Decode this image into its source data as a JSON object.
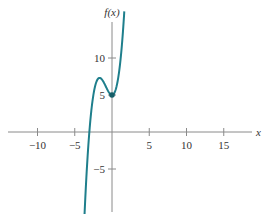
{
  "chart_data": {
    "type": "line",
    "title": "",
    "xlabel": "x",
    "ylabel": "f(x)",
    "xlim": [
      -14,
      19
    ],
    "ylim": [
      -11,
      15
    ],
    "grid": false,
    "legend": null,
    "x_ticks": [
      -10,
      -5,
      5,
      10,
      15
    ],
    "x_tick_labels": [
      "−10",
      "−5",
      "5",
      "10",
      "15"
    ],
    "y_ticks": [
      10,
      5,
      -5
    ],
    "y_tick_labels": [
      "10",
      "5",
      "−5"
    ],
    "series": [
      {
        "name": "f(x)",
        "color": "#1f7f8c",
        "function": "x^3 + 2.5x^2 + 5",
        "x": [
          -3.76,
          -3.5,
          -3.0,
          -2.5,
          -2.0,
          -1.67,
          -1.0,
          -0.5,
          0.0,
          0.5,
          1.0,
          1.5,
          1.65
        ],
        "y": [
          -12.9,
          -7.3,
          0.5,
          5.0,
          7.0,
          7.3,
          6.5,
          5.5,
          5.0,
          5.75,
          8.5,
          13.0,
          14.3
        ]
      }
    ],
    "annotations": [
      {
        "type": "point",
        "x": 0,
        "y": 5,
        "label": "local minimum marker"
      }
    ]
  },
  "labels": {
    "x_axis": "x",
    "y_axis": "f(x)"
  },
  "colors": {
    "curve": "#1f7f8c",
    "axis": "#8a8a8a",
    "text": "#333333"
  }
}
